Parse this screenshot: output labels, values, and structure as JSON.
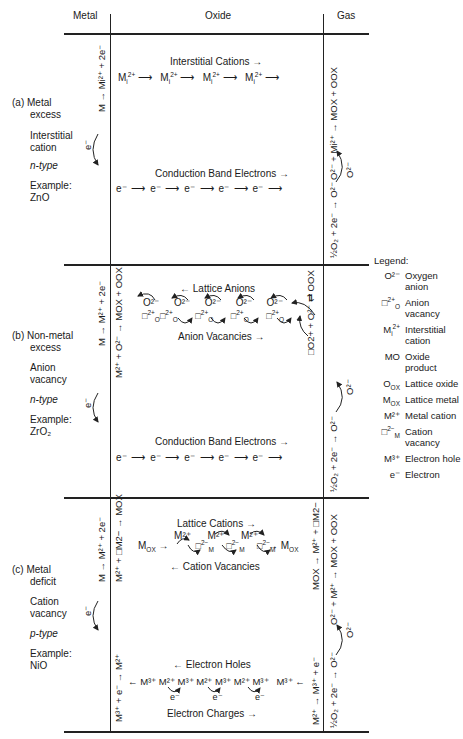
{
  "header": {
    "metal": "Metal",
    "oxide": "Oxide",
    "gas": "Gas"
  },
  "sections": [
    {
      "id": "a",
      "label_lines": [
        "(a)  Metal",
        "excess",
        "Interstitial",
        "cation",
        "n-type",
        "Example:",
        "ZnO"
      ],
      "case": "(a)  Metal",
      "case2": "excess",
      "defect": "Interstitial",
      "defect2": "cation",
      "type": "n-type",
      "example_label": "Example:",
      "example": "ZnO",
      "metal_reaction": "M → Mi²⁺ + 2e⁻",
      "gas_reaction_top": "O²⁻ + Mi²⁺ → MOX + OOX",
      "gas_reaction_bottom": "½O₂ + 2e⁻ → O²⁻",
      "gas_migrating": "O²⁻",
      "flow1_title": "Interstitial Cations",
      "flow1_items": [
        "Mi2+",
        "Mi2+",
        "Mi2+",
        "Mi2+"
      ],
      "flow2_title": "Conduction Band Electrons",
      "flow2_items": [
        "e⁻",
        "e⁻",
        "e⁻",
        "e⁻",
        "e⁻"
      ],
      "electron_label": "e⁻"
    },
    {
      "id": "b",
      "case": "(b)  Non-metal",
      "case2": "excess",
      "defect": "Anion",
      "defect2": "vacancy",
      "type": "n-type",
      "example_label": "Example:",
      "example": "ZrO₂",
      "metal_reaction": "M → M²⁺ + 2e⁻",
      "metal_reaction2": "M²⁺ + O²⁻ → MOX + OOX",
      "gas_reaction_top": "□O2+ + O²⁻ ⇄ OOX",
      "gas_reaction_bottom": "½O₂ + 2e⁻ → O²⁻",
      "gas_migrating": "O²⁻",
      "flow1_title": "Lattice Anions",
      "flow1_items": [
        "O²⁻",
        "O²⁻",
        "O²⁻",
        "O²⁻",
        "O²⁻"
      ],
      "vacancy_items": [
        "□O2+",
        "□O2+",
        "□O2+",
        "□O2+",
        "□O2+"
      ],
      "flow1b_title": "Anion Vacancies",
      "flow2_title": "Conduction Band Electrons",
      "flow2_items": [
        "e⁻",
        "e⁻",
        "e⁻",
        "e⁻",
        "e⁻"
      ],
      "electron_label": "e⁻"
    },
    {
      "id": "c",
      "case": "(c)  Metal",
      "case2": "deficit",
      "defect": "Cation",
      "defect2": "vacancy",
      "type": "p-type",
      "example_label": "Example:",
      "example": "NiO",
      "metal_reaction": "M → M²⁺ + 2e⁻",
      "metal_reaction2": "M²⁺ + □M2− → MOX",
      "metal_reaction3": "M³⁺ + e⁻ → M²⁺",
      "gas_reaction_top": "MOX → M²⁺ + □M2−",
      "gas_reaction_top2": "O²⁻ + M²⁺ → MOX + OOX",
      "gas_reaction_bottom": "M²⁺ → M³⁺ + e⁻",
      "gas_reaction_bottom2": "½O₂ + 2e⁻ → O²⁻",
      "gas_migrating": "O²⁻",
      "flow1_title": "Lattice Cations",
      "mox_left": "MOX",
      "mox_right": "MOX",
      "cation_items": [
        "M²⁺",
        "M²⁺",
        "M²⁺"
      ],
      "flow1b_title": "Cation Vacancies",
      "flow2_title": "Electron Holes",
      "hole_items": [
        "M³⁺",
        "M²⁺",
        "M³⁺",
        "M²⁺",
        "M³⁺",
        "M²⁺",
        "M³⁺",
        "M³⁺"
      ],
      "flow2b_title": "Electron Charges",
      "electron_label": "e⁻"
    }
  ],
  "legend": {
    "title": "Legend:",
    "items": [
      {
        "symbol": "O²⁻",
        "label": "Oxygen anion"
      },
      {
        "symbol": "□O2+",
        "label": "Anion vacancy"
      },
      {
        "symbol": "Mi2+",
        "label": "Interstitial cation"
      },
      {
        "symbol": "MO",
        "label": "Oxide product"
      },
      {
        "symbol": "OOX",
        "label": "Lattice oxide"
      },
      {
        "symbol": "MOX",
        "label": "Lattice metal"
      },
      {
        "symbol": "M²⁺",
        "label": "Metal cation"
      },
      {
        "symbol": "□M2−",
        "label": "Cation vacancy"
      },
      {
        "symbol": "M³⁺",
        "label": "Electron hole"
      },
      {
        "symbol": "e⁻",
        "label": "Electron"
      }
    ]
  }
}
